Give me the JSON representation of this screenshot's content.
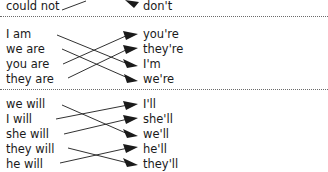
{
  "worksheet": {
    "type": "matching-exercise",
    "subject": "contractions",
    "width": 328,
    "height": 172,
    "line_color": "#1a1a1a",
    "divider_color": "#6b6b6b",
    "background": "#ffffff"
  },
  "groups": [
    {
      "id": "group-partial-top",
      "clipped": true,
      "left_items": [
        "could not"
      ],
      "right_items": [
        "don't"
      ],
      "connections": [
        {
          "from": 0,
          "to": 0
        }
      ]
    },
    {
      "id": "group-be-verbs",
      "clipped": false,
      "left_items": [
        "I am",
        "we are",
        "you are",
        "they are"
      ],
      "right_items": [
        "you're",
        "they're",
        "I'm",
        "we're"
      ],
      "connections": [
        {
          "from": 0,
          "to": 2
        },
        {
          "from": 1,
          "to": 3
        },
        {
          "from": 2,
          "to": 0
        },
        {
          "from": 3,
          "to": 1
        }
      ]
    },
    {
      "id": "group-will-verbs",
      "clipped": false,
      "left_items": [
        "we will",
        "I will",
        "she will",
        "they will",
        "he will"
      ],
      "right_items": [
        "I'll",
        "she'll",
        "we'll",
        "he'll",
        "they'll"
      ],
      "connections": [
        {
          "from": 0,
          "to": 2
        },
        {
          "from": 1,
          "to": 0
        },
        {
          "from": 2,
          "to": 1
        },
        {
          "from": 3,
          "to": 4
        },
        {
          "from": 4,
          "to": 3
        }
      ]
    }
  ],
  "dividers": [
    {
      "id": "divider-top",
      "y": 16
    },
    {
      "id": "divider-middle",
      "y": 89
    }
  ]
}
